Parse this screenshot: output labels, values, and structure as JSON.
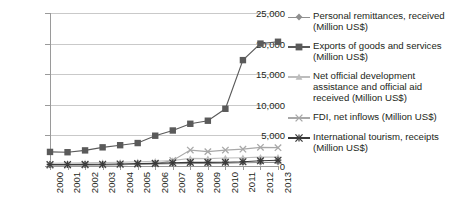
{
  "chart_data": {
    "type": "line",
    "title": "",
    "xlabel": "",
    "ylabel": "",
    "x": [
      "2000",
      "2001",
      "2002",
      "2003",
      "2004",
      "2005",
      "2006",
      "2007",
      "2008",
      "2009",
      "2010",
      "2011",
      "2012",
      "2013"
    ],
    "categories": [
      "2000",
      "2001",
      "2002",
      "2003",
      "2004",
      "2005",
      "2006",
      "2007",
      "2008",
      "2009",
      "2010",
      "2011",
      "2012",
      "2013"
    ],
    "ylim": [
      0,
      25000
    ],
    "yticks": [
      0,
      5000,
      10000,
      15000,
      20000,
      25000
    ],
    "ytick_labels": [
      "0",
      "5,000",
      "10,000",
      "15,000",
      "20,000",
      "25,000"
    ],
    "grid": true,
    "legend_position": "right",
    "series": [
      {
        "name": "Personal remittances, received (Million US$)",
        "marker": "diamond",
        "color": "#8f8f8f",
        "values": [
          130,
          140,
          160,
          190,
          230,
          280,
          330,
          380,
          430,
          420,
          470,
          520,
          560,
          600
        ]
      },
      {
        "name": "Exports of goods and services (Million US$)",
        "marker": "square",
        "color": "#5a5a5a",
        "values": [
          2300,
          2250,
          2550,
          3050,
          3400,
          3750,
          4950,
          5800,
          6900,
          7400,
          9350,
          17300,
          20000,
          20300
        ]
      },
      {
        "name": "Net official development assistance and official aid received (Million US$)",
        "marker": "triangle",
        "color": "#bdbdbd",
        "values": [
          450,
          470,
          520,
          560,
          620,
          700,
          780,
          900,
          1250,
          1200,
          1300,
          1350,
          1450,
          1450
        ]
      },
      {
        "name": "FDI, net inflows (Million US$)",
        "marker": "cross",
        "color": "#a8a8a8",
        "values": [
          100,
          120,
          150,
          180,
          220,
          280,
          350,
          900,
          2600,
          2350,
          2600,
          2750,
          3050,
          3000
        ]
      },
      {
        "name": "International tourism, receipts (Million US$)",
        "marker": "asterisk",
        "color": "#3a3a3a",
        "values": [
          250,
          250,
          260,
          280,
          320,
          380,
          430,
          520,
          600,
          600,
          620,
          700,
          850,
          950
        ]
      }
    ]
  },
  "legend": {
    "items": [
      {
        "label": "Personal remittances, received (Million US$)"
      },
      {
        "label": "Exports of goods and services (Million US$)"
      },
      {
        "label": "Net official development assistance and official aid received (Million US$)"
      },
      {
        "label": "FDI, net inflows (Million US$)"
      },
      {
        "label": "International tourism, receipts (Million US$)"
      }
    ]
  }
}
